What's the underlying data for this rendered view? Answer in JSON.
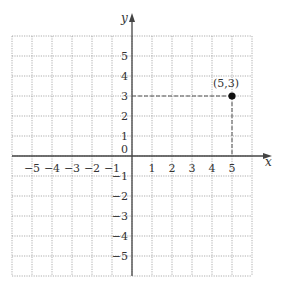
{
  "chart_data": {
    "type": "scatter",
    "title": "",
    "xlabel": "x",
    "ylabel": "y",
    "xlim": [
      -6,
      6
    ],
    "ylim": [
      -6,
      6
    ],
    "grid": true,
    "x_tick_labels": [
      "-5",
      "-4",
      "-3",
      "-2",
      "-1",
      "1",
      "2",
      "3",
      "4",
      "5"
    ],
    "y_tick_labels": [
      "5",
      "4",
      "3",
      "2",
      "1",
      "0",
      "-1",
      "-2",
      "-3",
      "-4",
      "-5"
    ],
    "points": [
      {
        "x": 5,
        "y": 3,
        "label": "(5,3)"
      }
    ],
    "guides": "dashed lines from point (5,3) to both axes"
  },
  "labels": {
    "x_axis": "x",
    "y_axis": "y",
    "origin": "0",
    "point": "(5,3)",
    "xticks": [
      "−5",
      "−4",
      "−3",
      "−2",
      "−1",
      "1",
      "2",
      "3",
      "4",
      "5"
    ],
    "yticks_pos": [
      "5",
      "4",
      "3",
      "2",
      "1"
    ],
    "yticks_neg": [
      "−1",
      "−2",
      "−3",
      "−4",
      "−5"
    ]
  }
}
